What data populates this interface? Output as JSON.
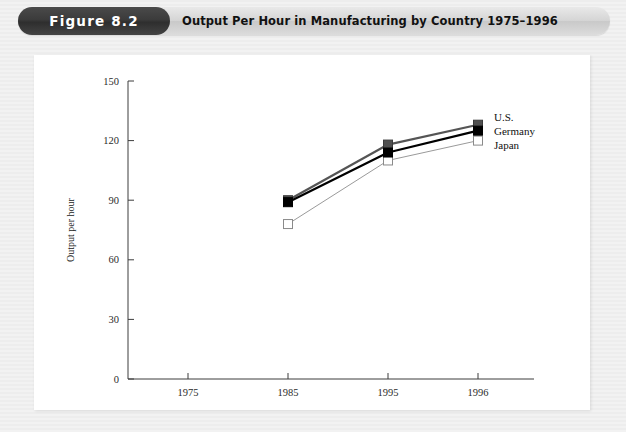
{
  "header": {
    "figure_pill_label": "Figure 8.2",
    "title": "Output Per Hour in Manufacturing by Country 1975–1996"
  },
  "chart_data": {
    "type": "line",
    "title": "Output Per Hour in Manufacturing by Country 1975–1996",
    "xlabel": "",
    "ylabel": "Output per hour",
    "categories": [
      "1975",
      "1985",
      "1995",
      "1996"
    ],
    "xtick_labels": [
      "1975",
      "1985",
      "1995",
      "1996"
    ],
    "ytick_labels": [
      "0",
      "30",
      "60",
      "90",
      "120",
      "150"
    ],
    "yticks": [
      0,
      30,
      60,
      90,
      120,
      150
    ],
    "ylim": [
      0,
      150
    ],
    "grid": false,
    "legend_position": "right-inline",
    "series": [
      {
        "name": "U.S.",
        "marker": "filled-square",
        "color": "#000000",
        "x": [
          "1985",
          "1995",
          "1996"
        ],
        "values": [
          89,
          114,
          125
        ]
      },
      {
        "name": "Germany",
        "marker": "gray-square",
        "color": "#555555",
        "x": [
          "1985",
          "1995",
          "1996"
        ],
        "values": [
          90,
          118,
          128
        ]
      },
      {
        "name": "Japan",
        "marker": "open-square",
        "color": "#9a9a9a",
        "x": [
          "1985",
          "1995",
          "1996"
        ],
        "values": [
          78,
          110,
          120
        ]
      }
    ]
  },
  "legend": {
    "items": [
      {
        "label": "U.S."
      },
      {
        "label": "Germany"
      },
      {
        "label": "Japan"
      }
    ]
  }
}
